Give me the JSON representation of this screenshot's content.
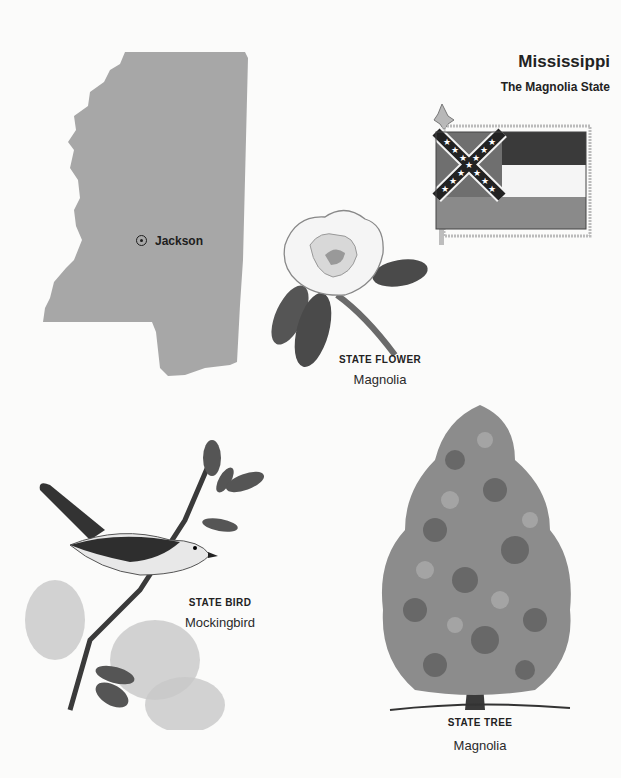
{
  "header": {
    "state_name": "Mississippi",
    "nickname": "The Magnolia State"
  },
  "map": {
    "icon": "state-outline-map",
    "fill_color": "#a7a7a7",
    "capital": {
      "name": "Jackson",
      "marker_icon": "capital-circle-dot-icon"
    }
  },
  "flag": {
    "icon": "state-flag-icon",
    "colors": {
      "top_stripe": "#3a3a3a",
      "middle_stripe": "#f5f5f5",
      "bottom_stripe": "#8a8a8a",
      "canton": "#6f6f6f"
    }
  },
  "state_flower": {
    "heading": "STATE FLOWER",
    "name": "Magnolia",
    "icon": "magnolia-flower-illustration"
  },
  "state_bird": {
    "heading": "STATE BIRD",
    "name": "Mockingbird",
    "icon": "mockingbird-illustration"
  },
  "state_tree": {
    "heading": "STATE TREE",
    "name": "Magnolia",
    "icon": "magnolia-tree-illustration"
  }
}
